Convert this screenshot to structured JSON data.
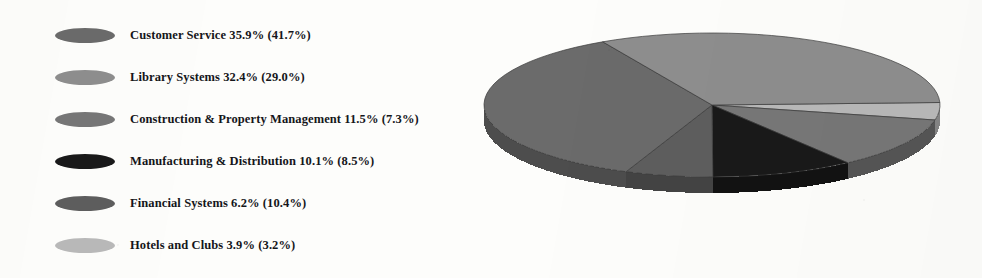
{
  "chart_data": {
    "type": "pie",
    "title": "",
    "subtitle": "",
    "xlabel": "",
    "ylabel": "",
    "legend_position": "left",
    "three_d": true,
    "value_format": "current % (prior %)",
    "categories": [
      "Customer Service",
      "Library Systems",
      "Construction & Property Management",
      "Manufacturing & Distribution",
      "Financial Systems",
      "Hotels and Clubs"
    ],
    "values": [
      35.9,
      32.4,
      11.5,
      10.1,
      6.2,
      3.9
    ],
    "prior_values": [
      41.7,
      29.0,
      7.3,
      8.5,
      10.4,
      3.2
    ],
    "colors": [
      "#6b6b6b",
      "#8e8e8e",
      "#777777",
      "#1a1a1a",
      "#5e5e5e",
      "#b9b9b9"
    ],
    "series": [
      {
        "name": "Current",
        "values": [
          35.9,
          32.4,
          11.5,
          10.1,
          6.2,
          3.9
        ]
      },
      {
        "name": "Prior",
        "values": [
          41.7,
          29.0,
          7.3,
          8.5,
          10.4,
          3.2
        ]
      }
    ]
  },
  "legend": {
    "items": [
      {
        "label": "Customer Service 35.9% (41.7%)",
        "name": "Customer Service",
        "value": "35.9%",
        "prior": "(41.7%)",
        "color": "#6b6b6b",
        "swatch_name": "legend-swatch-customer-service"
      },
      {
        "label": "Library Systems 32.4% (29.0%)",
        "name": "Library Systems",
        "value": "32.4%",
        "prior": "(29.0%)",
        "color": "#8e8e8e",
        "swatch_name": "legend-swatch-library-systems"
      },
      {
        "label": "Construction & Property Management 11.5% (7.3%)",
        "name": "Construction & Property Management",
        "value": "11.5%",
        "prior": "(7.3%)",
        "color": "#777777",
        "swatch_name": "legend-swatch-construction-property-management"
      },
      {
        "label": "Manufacturing & Distribution 10.1% (8.5%)",
        "name": "Manufacturing & Distribution",
        "value": "10.1%",
        "prior": "(8.5%)",
        "color": "#1a1a1a",
        "swatch_name": "legend-swatch-manufacturing-distribution"
      },
      {
        "label": "Financial Systems 6.2% (10.4%)",
        "name": "Financial Systems",
        "value": "6.2%",
        "prior": "(10.4%)",
        "color": "#5e5e5e",
        "swatch_name": "legend-swatch-financial-systems"
      },
      {
        "label": "Hotels and Clubs 3.9% (3.2%)",
        "name": "Hotels and Clubs",
        "value": "3.9%",
        "prior": "(3.2%)",
        "color": "#b9b9b9",
        "swatch_name": "legend-swatch-hotels-and-clubs"
      }
    ]
  },
  "pie": {
    "center_x": 242,
    "center_y": 87,
    "radius_x": 228,
    "radius_y": 72,
    "depth": 16,
    "start_angle": -2,
    "background": "#fdfdfb",
    "edge_color": "#3a3a3a"
  }
}
